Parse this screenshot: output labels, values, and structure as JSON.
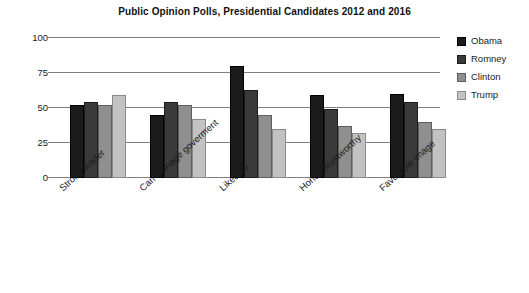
{
  "chart_data": {
    "type": "bar",
    "title": "Public Opinion Polls, Presidential Candidates 2012 and 2016",
    "xlabel": "",
    "ylabel": "",
    "ylim": [
      0,
      100
    ],
    "yticks": [
      0,
      25,
      50,
      75,
      100
    ],
    "grid": true,
    "legend_position": "right",
    "categories": [
      "Strong leader",
      "Can manage goverment",
      "Likeable",
      "Honest/trustworthy",
      "Favorable image"
    ],
    "series": [
      {
        "name": "Obama",
        "color": "#1b1b1b",
        "values": [
          52,
          45,
          80,
          59,
          60
        ]
      },
      {
        "name": "Romney",
        "color": "#3a3a3a",
        "values": [
          54,
          54,
          63,
          49,
          54
        ]
      },
      {
        "name": "Clinton",
        "color": "#8f8f8f",
        "values": [
          52,
          52,
          45,
          37,
          40
        ]
      },
      {
        "name": "Trump",
        "color": "#c2c2c2",
        "values": [
          59,
          42,
          35,
          32,
          35
        ]
      }
    ]
  }
}
